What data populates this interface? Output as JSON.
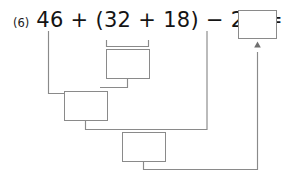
{
  "worksheet": {
    "problem_number": "(6)",
    "expression": "46 + (32 + 18) − 28 =",
    "expression_parts": {
      "first_term": "46",
      "operator_1": "+",
      "open_paren": "(",
      "second_term": "32",
      "operator_2": "+",
      "third_term": "18",
      "close_paren": ")",
      "operator_3": "−",
      "fourth_term": "28",
      "equals": "="
    },
    "answer_value": "",
    "answer_placeholder": "",
    "work_boxes": [
      {
        "id": "step-1-box",
        "label": "",
        "step": 1,
        "source": "32 + 18"
      },
      {
        "id": "step-2-box",
        "label": "",
        "step": 2,
        "source": "46 + step1"
      },
      {
        "id": "step-3-box",
        "label": "",
        "step": 3,
        "source": "step2 − 28"
      }
    ],
    "colors": {
      "line": "#8a8a8a",
      "text": "#141414",
      "problem_number": "#1a1a1a",
      "background": "#ffffff",
      "box_border": "#8a8a8a"
    }
  }
}
